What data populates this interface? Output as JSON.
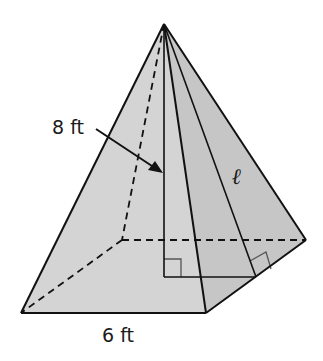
{
  "diagram": {
    "type": "square-pyramid",
    "labels": {
      "height": "8 ft",
      "base_edge": "6 ft",
      "slant_height": "ℓ"
    },
    "colors": {
      "face_light": "#d4d4d4",
      "face_dark": "#c6c6c6",
      "edge": "#111111",
      "right_angle_marker": "#555555"
    },
    "points": {
      "apex": [
        164,
        24
      ],
      "front_left": [
        21,
        313
      ],
      "front_right": [
        206,
        313
      ],
      "back_right": [
        306,
        240
      ],
      "back_left_hidden": [
        122,
        240
      ],
      "base_center": [
        164,
        277
      ],
      "slant_foot": [
        256,
        277
      ]
    }
  }
}
